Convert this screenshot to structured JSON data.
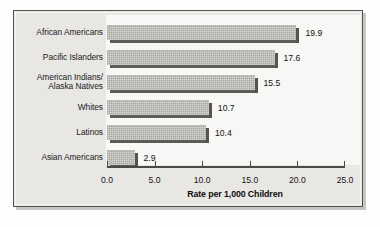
{
  "chart_data": {
    "type": "bar",
    "orientation": "horizontal",
    "title": "",
    "xlabel": "Rate per 1,000 Children",
    "ylabel": "",
    "xlim": [
      0.0,
      25.0
    ],
    "xticks": [
      "0.0",
      "5.0",
      "10.0",
      "15.0",
      "20.0",
      "25.0"
    ],
    "xtick_values": [
      0.0,
      5.0,
      10.0,
      15.0,
      20.0,
      25.0
    ],
    "grid": false,
    "legend": null,
    "categories": [
      "African Americans",
      "Pacific Islanders",
      "American Indians/\nAlaska Natives",
      "Whites",
      "Latinos",
      "Asian Americans"
    ],
    "values": [
      19.9,
      17.6,
      15.5,
      10.7,
      10.4,
      2.9
    ],
    "value_labels": [
      "19.9",
      "17.6",
      "15.5",
      "10.7",
      "10.4",
      "2.9"
    ],
    "bar_color": "#a9a8a4",
    "bar_shadow_color": "#56544f",
    "axis_color": "#4c4a46",
    "frame_color": "#e8e7e4",
    "plot_background": "#f7f7f5"
  }
}
